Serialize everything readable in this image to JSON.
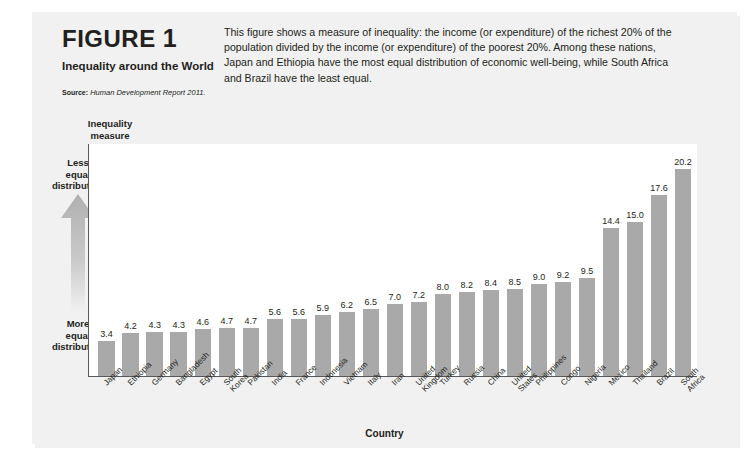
{
  "figure": {
    "label": "FIGURE",
    "number": "1",
    "subtitle": "Inequality around the World",
    "source_label": "Source:",
    "source_text": "Human Development Report 2011.",
    "description": "This figure shows a measure of inequality: the income (or expenditure) of the richest 20% of the population divided by the income (or expenditure) of the poorest 20%. Among these nations, Japan and Ethiopia have the most equal distribution of economic well-being, while South Africa and Brazil have the least equal."
  },
  "axes": {
    "y_title": "Inequality\nmeasure",
    "y_note_top": "Less\nequal\ndistribution",
    "y_note_bottom": "More\nequal\ndistribution",
    "x_title": "Country",
    "arrow_icon": "up-arrow-icon"
  },
  "colors": {
    "bar": "#a9a9a9",
    "card": "#f1f1f1",
    "plot_background": "#ffffff",
    "axis_line": "#58585a",
    "text": "#231f20",
    "arrow": "#b3b3b3"
  },
  "chart_data": {
    "type": "bar",
    "title": "Inequality around the World",
    "xlabel": "Country",
    "ylabel": "Inequality measure",
    "ylim": [
      0,
      22.5
    ],
    "grid": false,
    "legend": "none",
    "categories": [
      "Japan",
      "Ethiopia",
      "Germany",
      "Bangladesh",
      "Egypt",
      "South Korea",
      "Pakistan",
      "India",
      "France",
      "Indonesia",
      "Vietnam",
      "Italy",
      "Iran",
      "United\nKingdom",
      "Turkey",
      "Russia",
      "China",
      "United States",
      "Philippines",
      "Congo",
      "Nigeria",
      "Mexico",
      "Thailand",
      "Brazil",
      "South Africa"
    ],
    "values": [
      3.4,
      4.2,
      4.3,
      4.3,
      4.6,
      4.7,
      4.7,
      5.6,
      5.6,
      5.9,
      6.2,
      6.5,
      7.0,
      7.2,
      8.0,
      8.2,
      8.4,
      8.5,
      9.0,
      9.2,
      9.5,
      14.4,
      15.0,
      17.6,
      20.2
    ],
    "value_labels": [
      "3.4",
      "4.2",
      "4.3",
      "4.3",
      "4.6",
      "4.7",
      "4.7",
      "5.6",
      "5.6",
      "5.9",
      "6.2",
      "6.5",
      "7.0",
      "7.2",
      "8.0",
      "8.2",
      "8.4",
      "8.5",
      "9.0",
      "9.2",
      "9.5",
      "14.4",
      "15.0",
      "17.6",
      "20.2"
    ],
    "annotations": [
      "Less equal distribution",
      "More equal distribution"
    ]
  }
}
